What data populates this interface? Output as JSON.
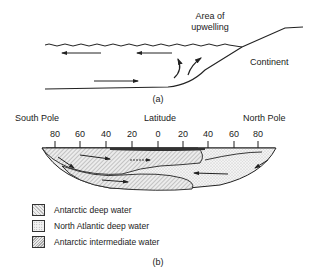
{
  "panel_a": {
    "caption": "(a)",
    "labels": {
      "upwelling_line1": "Area of",
      "upwelling_line2": "upwelling",
      "continent": "Continent"
    }
  },
  "panel_b": {
    "caption": "(b)",
    "axis": {
      "left_label": "South Pole",
      "center_label": "Latitude",
      "right_label": "North Pole",
      "ticks": [
        "80",
        "60",
        "40",
        "20",
        "0",
        "20",
        "40",
        "60",
        "80"
      ]
    },
    "legend": [
      {
        "label": "Antarctic deep water",
        "pattern": "hatched"
      },
      {
        "label": "North Atlantic deep water",
        "pattern": "stippled"
      },
      {
        "label": "Antarctic intermediate water",
        "pattern": "cross-hatched"
      }
    ]
  }
}
